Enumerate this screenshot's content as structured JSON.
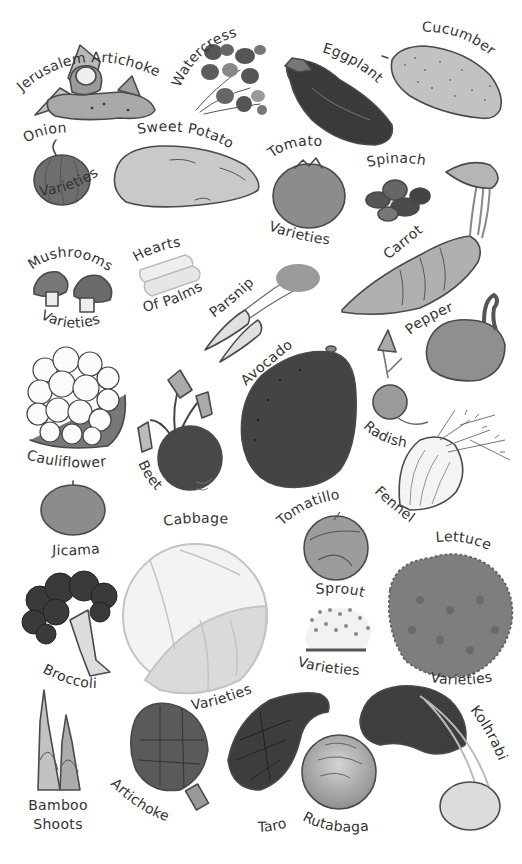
{
  "poster": {
    "title": "Vegetables",
    "colors": {
      "background": "#ffffff",
      "text": "#333333",
      "outline": "#4a4a4a",
      "dark": "#3c3c3c",
      "mid": "#7a7a7a",
      "light": "#b5b5b5",
      "pale": "#dcdcdc"
    },
    "labels": {
      "jerusalem_artichoke": "Jerusalem Artichoke",
      "watercress": "Watercress",
      "eggplant": "Eggplant",
      "cucumber": "Cucumber",
      "onion": "Onion",
      "onion_varieties": "Varieties",
      "sweet_potato": "Sweet Potato",
      "tomato": "Tomato",
      "tomato_varieties": "Varieties",
      "spinach": "Spinach",
      "carrot": "Carrot",
      "mushrooms": "Mushrooms",
      "mushrooms_varieties": "Varieties",
      "hearts": "Hearts",
      "of_palms": "Of Palms",
      "parsnip": "Parsnip",
      "pepper": "Pepper",
      "avocado": "Avocado",
      "radish": "Radish",
      "cauliflower": "Cauliflower",
      "beet": "Beet",
      "fennel": "Fennel",
      "tomatillo": "Tomatillo",
      "jicama": "Jicama",
      "cabbage": "Cabbage",
      "cabbage_varieties": "Varieties",
      "lettuce": "Lettuce",
      "lettuce_varieties": "Varieties",
      "sprout": "Sprout",
      "sprout_varieties": "Varieties",
      "broccoli": "Broccoli",
      "bamboo": "Bamboo",
      "shoots": "Shoots",
      "artichoke": "Artichoke",
      "taro": "Taro",
      "rutabaga": "Rutabaga",
      "kohlrabi": "Kolhrabi"
    }
  }
}
